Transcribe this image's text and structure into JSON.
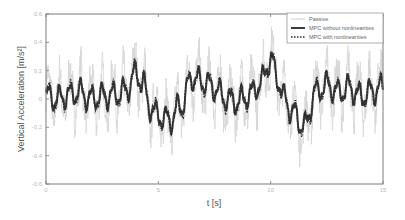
{
  "chart_data": {
    "type": "line",
    "title": "",
    "xlabel": "t [s]",
    "ylabel": "Vertical Acceleration [m/s²]",
    "xlim": [
      0,
      15
    ],
    "ylim": [
      -0.6,
      0.6
    ],
    "xticks": [
      0,
      5,
      10,
      15
    ],
    "xtick_labels": [
      "0",
      "5",
      "10",
      "15"
    ],
    "yticks": [
      0.6,
      0.4,
      0.2,
      0,
      -0.2,
      -0.4,
      -0.6
    ],
    "ytick_labels": [
      "0.6",
      "0.4",
      "0.2",
      "0",
      "-0.2",
      "-0.4",
      "-0.6"
    ],
    "grid": false,
    "legend_position": "upper right",
    "envelope_x": [
      0,
      0.5,
      1,
      1.5,
      2,
      2.5,
      3,
      3.5,
      4,
      4.3,
      4.6,
      5,
      5.5,
      6,
      6.5,
      7,
      7.5,
      8,
      8.5,
      9,
      9.5,
      10,
      10.3,
      10.6,
      11,
      11.5,
      12,
      12.5,
      13,
      13.5,
      14,
      14.5,
      15
    ],
    "envelope_y": [
      0.02,
      0.0,
      0.03,
      0.05,
      0.0,
      0.02,
      0.03,
      0.05,
      0.18,
      0.12,
      -0.05,
      -0.12,
      -0.15,
      -0.05,
      0.15,
      0.12,
      0.08,
      0.0,
      -0.02,
      0.02,
      0.1,
      0.28,
      0.15,
      0.0,
      -0.1,
      -0.2,
      0.05,
      0.1,
      0.05,
      0.08,
      0.02,
      0.05,
      0.08
    ],
    "series": [
      {
        "name": "Passive",
        "style": "thin-light",
        "color": "#d6d6d6",
        "osc_amp": 0.16,
        "osc_freq_hz": 2.1,
        "noise": 0.12
      },
      {
        "name": "MPC without nonlinearities",
        "style": "solid-thick",
        "color": "#3a3a3a",
        "osc_amp": 0.075,
        "osc_freq_hz": 2.1,
        "noise": 0.01
      },
      {
        "name": "MPC with nonlinearities",
        "style": "dotted",
        "color": "#2a2a2a",
        "osc_amp": 0.08,
        "osc_freq_hz": 2.1,
        "noise": 0.015
      }
    ]
  },
  "legend": {
    "items": [
      {
        "label": "Passive"
      },
      {
        "label": "MPC without nonlinearities"
      },
      {
        "label": "MPC with nonlinearities"
      }
    ]
  }
}
